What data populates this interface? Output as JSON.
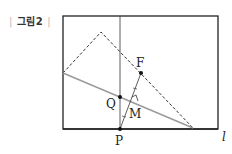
{
  "figure": {
    "caption": "그림2",
    "caption_left_bar": "|",
    "caption_right_bar": "|"
  },
  "points": {
    "F": {
      "label": "F",
      "x": 141,
      "y": 73
    },
    "Q": {
      "label": "Q",
      "x": 120,
      "y": 97
    },
    "M": {
      "label": "M",
      "x": 133,
      "y": 102
    },
    "P": {
      "label": "P",
      "x": 120,
      "y": 129
    }
  },
  "line_label": "l",
  "colors": {
    "frame": "#222222",
    "fold_line": "#999999",
    "dashed": "#333333",
    "points": "#111111"
  }
}
